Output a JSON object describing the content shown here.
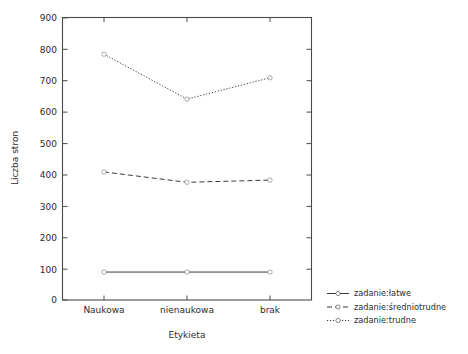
{
  "chart_data": {
    "type": "line",
    "title": "",
    "xlabel": "Etykieta",
    "ylabel": "Liczba stron",
    "categories": [
      "Naukowa",
      "nienaukowa",
      "brak"
    ],
    "ylim": [
      0,
      900
    ],
    "yticks": [
      0,
      100,
      200,
      300,
      400,
      500,
      600,
      700,
      800,
      900
    ],
    "ytick_labels": [
      "0",
      "100",
      "200",
      "300",
      "400",
      "500",
      "600",
      "700",
      "800",
      "900"
    ],
    "grid": false,
    "legend_position": "right-bottom-outside",
    "series": [
      {
        "name": "zadanie:łatwe",
        "linestyle": "solid",
        "color": "#222222",
        "values": [
          89,
          89,
          89
        ]
      },
      {
        "name": "zadanie:średniotrudne",
        "linestyle": "dashed",
        "color": "#222222",
        "values": [
          408,
          375,
          382
        ]
      },
      {
        "name": "zadanie:trudne",
        "linestyle": "dotted",
        "color": "#222222",
        "values": [
          783,
          640,
          708
        ]
      }
    ]
  },
  "axes": {
    "y_title": "Liczba stron",
    "x_title": "Etykieta",
    "yticks": [
      {
        "label": "900"
      },
      {
        "label": "800"
      },
      {
        "label": "700"
      },
      {
        "label": "600"
      },
      {
        "label": "500"
      },
      {
        "label": "400"
      },
      {
        "label": "300"
      },
      {
        "label": "200"
      },
      {
        "label": "100"
      },
      {
        "label": "0"
      }
    ],
    "xticks": [
      {
        "label": "Naukowa"
      },
      {
        "label": "nienaukowa"
      },
      {
        "label": "brak"
      }
    ]
  },
  "legend": {
    "items": [
      {
        "label": "zadanie:łatwe",
        "style": "solid"
      },
      {
        "label": "zadanie:średniotrudne",
        "style": "dashed"
      },
      {
        "label": "zadanie:trudne",
        "style": "dotted"
      }
    ]
  }
}
